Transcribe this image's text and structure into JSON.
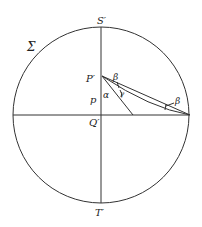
{
  "diagram": {
    "colors": {
      "line": "#333333",
      "text": "#222222",
      "background": "#ffffff"
    },
    "circle": {
      "cx": 101,
      "cy": 115,
      "r": 88
    },
    "labels": {
      "sigma": "Σ",
      "S": "S′",
      "T": "T′",
      "P": "P′",
      "Q": "Q′",
      "p": "p",
      "alpha": "α",
      "beta_top": "β",
      "gamma": "γ",
      "beta_right": "β"
    },
    "points": {
      "P": [
        102,
        76
      ],
      "Q": [
        101,
        115
      ],
      "S": [
        101,
        27
      ],
      "T": [
        101,
        203
      ],
      "end_right": [
        190,
        115
      ],
      "end_steep": [
        133,
        115
      ]
    }
  }
}
